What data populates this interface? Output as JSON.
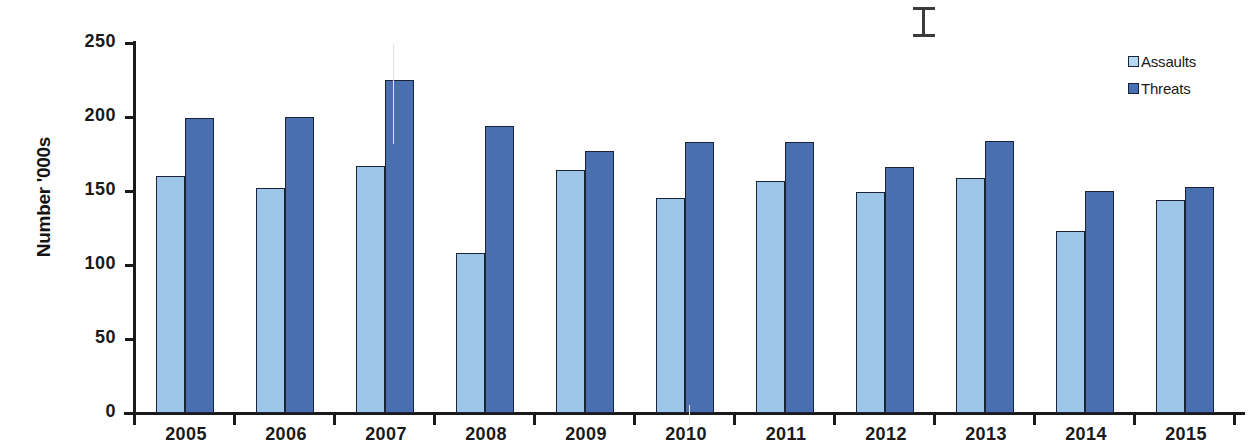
{
  "chart_data": {
    "type": "bar",
    "title": "",
    "xlabel": "",
    "ylabel": "Number '000s",
    "categories": [
      "2005",
      "2006",
      "2007",
      "2008",
      "2009",
      "2010",
      "2011",
      "2012",
      "2013",
      "2014",
      "2015"
    ],
    "series": [
      {
        "name": "Assaults",
        "color": "#9dc6e8",
        "values": [
          160,
          152,
          167,
          108,
          164,
          145,
          157,
          149,
          159,
          123,
          144
        ]
      },
      {
        "name": "Threats",
        "color": "#4a6fb0",
        "values": [
          199,
          200,
          225,
          194,
          177,
          183,
          183,
          166,
          184,
          150,
          153
        ]
      }
    ],
    "ylim": [
      0,
      250
    ],
    "yticks": [
      "0",
      "50",
      "100",
      "150",
      "200",
      "250"
    ],
    "ytick_values": [
      0,
      50,
      100,
      150,
      200,
      250
    ],
    "grid": false,
    "legend_position": "top-right"
  },
  "legend": {
    "items": [
      {
        "label": "Assaults",
        "swatch": "legend-swatch-assaults"
      },
      {
        "label": "Threats",
        "swatch": "legend-swatch-threats"
      }
    ]
  },
  "artifacts": {
    "text_cursor": "i-beam-cursor"
  }
}
